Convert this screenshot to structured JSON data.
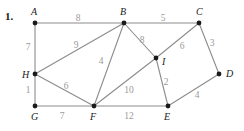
{
  "problem": {
    "number": "1."
  },
  "colors": {
    "edge": "#8c8c8c",
    "vertex": "#1a1a1a",
    "weight_text": "#9a9a9a",
    "vertex_text": "#1a1a1a",
    "background": "#ffffff"
  },
  "chart_data": {
    "type": "diagram",
    "title": "",
    "nodes": [
      {
        "id": "A",
        "label": "A",
        "x": 35,
        "y": 23,
        "label_x": 31,
        "label_y": 15
      },
      {
        "id": "B",
        "label": "B",
        "x": 124,
        "y": 23,
        "label_x": 120,
        "label_y": 15
      },
      {
        "id": "C",
        "label": "C",
        "x": 199,
        "y": 23,
        "label_x": 196,
        "label_y": 15
      },
      {
        "id": "D",
        "label": "D",
        "x": 219,
        "y": 74,
        "label_x": 226,
        "label_y": 77
      },
      {
        "id": "E",
        "label": "E",
        "x": 168,
        "y": 106,
        "label_x": 164,
        "label_y": 120
      },
      {
        "id": "F",
        "label": "F",
        "x": 94,
        "y": 106,
        "label_x": 90,
        "label_y": 120
      },
      {
        "id": "G",
        "label": "G",
        "x": 35,
        "y": 106,
        "label_x": 31,
        "label_y": 120
      },
      {
        "id": "H",
        "label": "H",
        "x": 35,
        "y": 74,
        "label_x": 22,
        "label_y": 78
      },
      {
        "id": "I",
        "label": "I",
        "x": 156,
        "y": 58,
        "label_x": 162,
        "label_y": 65
      }
    ],
    "edges": [
      {
        "from": "A",
        "to": "B",
        "weight": 8,
        "label_x": 78,
        "label_y": 21
      },
      {
        "from": "B",
        "to": "C",
        "weight": 5,
        "label_x": 163,
        "label_y": 21
      },
      {
        "from": "A",
        "to": "H",
        "weight": 7,
        "label_x": 28,
        "label_y": 50
      },
      {
        "from": "H",
        "to": "B",
        "weight": 9,
        "label_x": 76,
        "label_y": 48
      },
      {
        "from": "B",
        "to": "I",
        "weight": 8,
        "label_x": 142,
        "label_y": 43
      },
      {
        "from": "C",
        "to": "I",
        "weight": 6,
        "label_x": 182,
        "label_y": 49
      },
      {
        "from": "C",
        "to": "D",
        "weight": 3,
        "label_x": 212,
        "label_y": 46
      },
      {
        "from": "H",
        "to": "G",
        "weight": 1,
        "label_x": 28,
        "label_y": 93
      },
      {
        "from": "H",
        "to": "F",
        "weight": 6,
        "label_x": 66,
        "label_y": 89
      },
      {
        "from": "B",
        "to": "F",
        "weight": 4,
        "label_x": 101,
        "label_y": 64
      },
      {
        "from": "F",
        "to": "I",
        "weight": 10,
        "label_x": 129,
        "label_y": 93
      },
      {
        "from": "I",
        "to": "E",
        "weight": 2,
        "label_x": 166,
        "label_y": 85
      },
      {
        "from": "D",
        "to": "E",
        "weight": 4,
        "label_x": 197,
        "label_y": 98
      },
      {
        "from": "G",
        "to": "F",
        "weight": 7,
        "label_x": 62,
        "label_y": 119
      },
      {
        "from": "F",
        "to": "E",
        "weight": 12,
        "label_x": 129,
        "label_y": 119
      }
    ]
  }
}
